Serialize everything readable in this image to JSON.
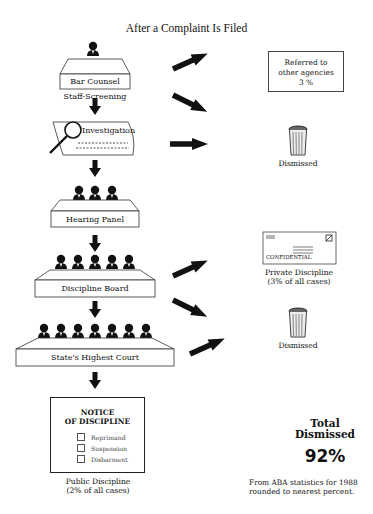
{
  "title": "After a Complaint Is Filed",
  "stages": [
    {
      "label": "Bar Counsel",
      "sublabel": "Staff-Screening",
      "figures": 1
    },
    {
      "label": "Investigation",
      "figures": 0
    },
    {
      "label": "Hearing Panel",
      "figures": 3
    },
    {
      "label": "Discipline Board",
      "figures": 5
    },
    {
      "label": "State's Highest Court",
      "figures": 7
    }
  ],
  "outcomes": {
    "referred": {
      "line1": "Referred to",
      "line2": "other agencies",
      "percent": "3 %"
    },
    "dismissed_1": "Dismissed",
    "private": {
      "stamp": "CONFIDENTIAL",
      "line1": "Private Discipline",
      "line2": "(3% of all cases)"
    },
    "dismissed_2": "Dismissed",
    "public": {
      "notice_line1": "NOTICE",
      "notice_line2": "OF DISCIPLINE",
      "options": [
        "Reprimand",
        "Suspension",
        "Disbarment"
      ],
      "line1": "Public Discipline",
      "line2": "(2% of all cases)"
    }
  },
  "total": {
    "line1": "Total",
    "line2": "Dismissed",
    "percent": "92%"
  },
  "footnote": {
    "line1": "From ABA statistics for 1988",
    "line2": "rounded to nearest percent."
  },
  "colors": {
    "ink": "#111111",
    "line": "#444444",
    "background": "#ffffff"
  }
}
